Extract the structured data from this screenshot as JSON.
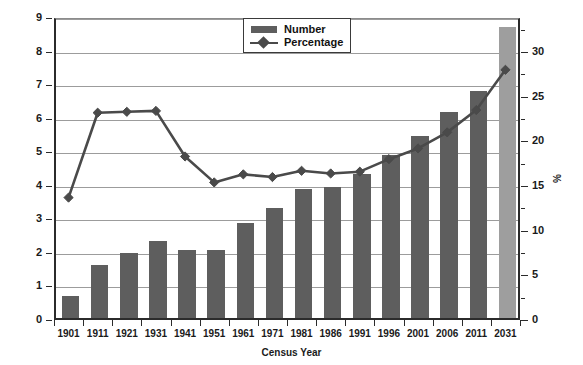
{
  "chart_data": {
    "type": "bar",
    "title": "",
    "xlabel": "Census Year",
    "ylabel": "Millions",
    "y2label": "%",
    "ylim": [
      0,
      9
    ],
    "y2lim": [
      0,
      33.8
    ],
    "grid": true,
    "legend_position": "top-center",
    "categories": [
      "1901",
      "1911",
      "1921",
      "1931",
      "1941",
      "1951",
      "1961",
      "1971",
      "1981",
      "1986",
      "1991",
      "1996",
      "2001",
      "2006",
      "2011",
      "2031"
    ],
    "yticks": [
      "0",
      "1",
      "2",
      "3",
      "4",
      "5",
      "6",
      "7",
      "8",
      "9"
    ],
    "y2ticks": [
      "0",
      "5",
      "10",
      "15",
      "20",
      "25",
      "30"
    ],
    "series": [
      {
        "name": "Number",
        "render": "bar",
        "axis": "left",
        "unit": "Millions",
        "color": "#5e5e5e",
        "projected_color": "#9e9e9e",
        "projected_categories": [
          "2031"
        ],
        "values": [
          0.65,
          1.57,
          1.95,
          2.3,
          2.02,
          2.04,
          2.82,
          3.27,
          3.83,
          3.9,
          4.3,
          4.85,
          5.42,
          6.15,
          6.78,
          8.68
        ]
      },
      {
        "name": "Percentage",
        "render": "line",
        "axis": "right",
        "unit": "%",
        "color": "#4a4a4a",
        "marker": "diamond",
        "values": [
          13.7,
          23.2,
          23.3,
          23.4,
          18.3,
          15.4,
          16.3,
          16.0,
          16.7,
          16.4,
          16.6,
          18.0,
          19.2,
          21.0,
          23.5,
          28.0
        ]
      }
    ]
  },
  "legend": {
    "items": [
      {
        "label": "Number",
        "type": "bar"
      },
      {
        "label": "Percentage",
        "type": "line-marker"
      }
    ]
  },
  "axes": {
    "left_title": "Millions",
    "right_title": "%",
    "bottom_title": "Census Year"
  }
}
